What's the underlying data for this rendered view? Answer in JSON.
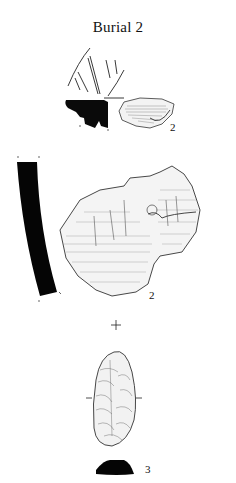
{
  "figure": {
    "title": "Burial 2",
    "items": [
      {
        "id": "sherd-rim",
        "label": "2",
        "description": "pottery rim sherd with incised lines, profile section and exterior view"
      },
      {
        "id": "sherd-body",
        "label": "2",
        "description": "pottery body sherd with curved black profile section and exterior view"
      },
      {
        "id": "flint-tool",
        "label": "3",
        "description": "bifacially flaked flint tool with cross-section"
      }
    ]
  },
  "colors": {
    "ink": "#111111",
    "background": "#ffffff"
  }
}
